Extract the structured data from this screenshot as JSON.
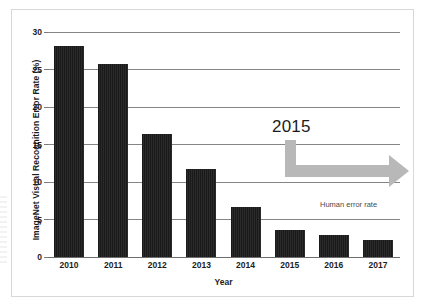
{
  "figure": {
    "frame_border_color": "#d8d8d8",
    "background": "#ffffff"
  },
  "chart_data": {
    "type": "bar",
    "title": "",
    "subtitle": "",
    "xlabel": "Year",
    "ylabel": "ImageNet Visual Recognition Error Rate (%)",
    "categories": [
      "2010",
      "2011",
      "2012",
      "2013",
      "2014",
      "2015",
      "2016",
      "2017"
    ],
    "values": [
      28.2,
      25.7,
      16.4,
      11.7,
      6.7,
      3.6,
      3.0,
      2.3
    ],
    "series": [
      {
        "name": "ImageNet Visual Recognition Error Rate (%)",
        "values": [
          28.2,
          25.7,
          16.4,
          11.7,
          6.7,
          3.6,
          3.0,
          2.3
        ]
      }
    ],
    "ylim": [
      0,
      30
    ],
    "yticks": [
      0,
      5,
      10,
      15,
      20,
      25,
      30
    ],
    "ytick_labels": [
      "0",
      "5",
      "10",
      "15",
      "20",
      "25",
      "30"
    ],
    "grid": true,
    "grid_axis": "y",
    "grid_color": "#858585",
    "bar_color": "#1a1a1a",
    "legend": false,
    "legend_position": "none",
    "annotations": [
      {
        "name": "year-2015-callout",
        "text": "2015",
        "kind": "text"
      },
      {
        "name": "human-error-rate-label",
        "text": "Human error rate",
        "kind": "text",
        "near_value": 5
      },
      {
        "name": "trend-arrow",
        "text": "",
        "kind": "arrow",
        "color": "#b8b8b8",
        "direction": "right",
        "shape": "L-shaped elbow"
      }
    ]
  },
  "axes": {
    "y": {
      "ticks": [
        {
          "label": "30",
          "value": 30
        },
        {
          "label": "25",
          "value": 25
        },
        {
          "label": "20",
          "value": 20
        },
        {
          "label": "15",
          "value": 15
        },
        {
          "label": "10",
          "value": 10
        },
        {
          "label": "5",
          "value": 5
        },
        {
          "label": "0",
          "value": 0
        }
      ],
      "title": "ImageNet Visual Recognition Error Rate (%)"
    },
    "x": {
      "ticks": [
        {
          "label": "2010"
        },
        {
          "label": "2011"
        },
        {
          "label": "2012"
        },
        {
          "label": "2013"
        },
        {
          "label": "2014"
        },
        {
          "label": "2015"
        },
        {
          "label": "2016"
        },
        {
          "label": "2017"
        }
      ],
      "title": "Year"
    }
  },
  "annotations": {
    "year_callout": "2015",
    "human_error_rate": "Human error rate"
  }
}
